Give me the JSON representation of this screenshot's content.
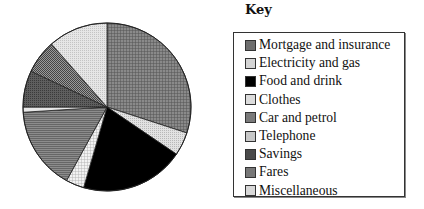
{
  "chart_data": {
    "type": "pie",
    "title": "",
    "legend_title": "Key",
    "legend_position": "right",
    "start_angle_deg": 0,
    "direction": "clockwise",
    "unit": "percent (estimated from slice angles)",
    "categories": [
      "Mortgage and insurance",
      "Electricity and gas",
      "Food and drink",
      "Clothes",
      "Car and petrol",
      "Telephone",
      "Savings",
      "Fares",
      "Miscellaneous"
    ],
    "values": [
      30,
      4.5,
      20,
      3.5,
      16,
      1,
      7,
      6.5,
      11.5
    ],
    "colors": [
      "#6e6e6e",
      "#d4d4d4",
      "#000000",
      "#dcdcdc",
      "#7a7a7a",
      "#c8c8c8",
      "#4a4a4a",
      "#777777",
      "#d8d8d8"
    ],
    "patterns": [
      "fine-crosshatch-dark",
      "light-dots",
      "solid-black",
      "checker-light",
      "horizontal-lines-mid",
      "light",
      "dark-crosshatch",
      "dither-mid",
      "light-dots"
    ]
  },
  "key": {
    "title": "Key",
    "items": [
      {
        "label": "Mortgage and insurance",
        "color": "#6e6e6e"
      },
      {
        "label": "Electricity and gas",
        "color": "#d4d4d4"
      },
      {
        "label": "Food and drink",
        "color": "#000000"
      },
      {
        "label": "Clothes",
        "color": "#dcdcdc"
      },
      {
        "label": "Car and petrol",
        "color": "#7a7a7a"
      },
      {
        "label": "Telephone",
        "color": "#c8c8c8"
      },
      {
        "label": "Savings",
        "color": "#4a4a4a"
      },
      {
        "label": "Fares",
        "color": "#777777"
      },
      {
        "label": "Miscellaneous",
        "color": "#d8d8d8"
      }
    ]
  }
}
